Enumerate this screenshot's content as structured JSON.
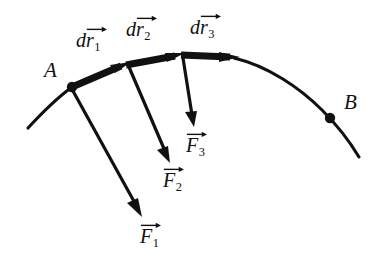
{
  "figure": {
    "type": "physics-vector-diagram",
    "background_color": "#ffffff",
    "ink_color": "#111111",
    "width": 378,
    "height": 268
  },
  "points": [
    {
      "id": "A",
      "label": "A",
      "label_x": 44,
      "label_y": 60,
      "dot_x": 72,
      "dot_y": 87,
      "dot_r": 5.2
    },
    {
      "id": "B",
      "label": "B",
      "label_x": 344,
      "label_y": 92,
      "dot_x": 330,
      "dot_y": 118,
      "dot_r": 5.2
    }
  ],
  "path": {
    "name": "trajectory-curve",
    "tail_start": {
      "x": 28,
      "y": 128
    },
    "tail_end": {
      "x": 72,
      "y": 87
    },
    "head_start": {
      "x": 234,
      "y": 58
    },
    "head_end": {
      "x": 359,
      "y": 157
    },
    "stroke_width": 3
  },
  "displacement_vectors": [
    {
      "id": "dr1",
      "prefix": "d",
      "symbol": "r",
      "subscript": "1",
      "from": {
        "x": 72,
        "y": 87
      },
      "to": {
        "x": 127,
        "y": 64
      },
      "label_x": 76,
      "label_y": 28,
      "stroke_width": 7
    },
    {
      "id": "dr2",
      "prefix": "d",
      "symbol": "r",
      "subscript": "2",
      "from": {
        "x": 127,
        "y": 64
      },
      "to": {
        "x": 181,
        "y": 55
      },
      "label_x": 126,
      "label_y": 17,
      "stroke_width": 7
    },
    {
      "id": "dr3",
      "prefix": "d",
      "symbol": "r",
      "subscript": "3",
      "from": {
        "x": 181,
        "y": 55
      },
      "to": {
        "x": 236,
        "y": 58
      },
      "label_x": 190,
      "label_y": 15,
      "stroke_width": 7
    }
  ],
  "force_vectors": [
    {
      "id": "F1",
      "symbol": "F",
      "subscript": "1",
      "from": {
        "x": 73,
        "y": 90
      },
      "to": {
        "x": 142,
        "y": 216
      },
      "label_x": 140,
      "label_y": 224,
      "stroke_width": 3.2
    },
    {
      "id": "F2",
      "symbol": "F",
      "subscript": "2",
      "from": {
        "x": 129,
        "y": 66
      },
      "to": {
        "x": 170,
        "y": 162
      },
      "label_x": 163,
      "label_y": 168,
      "stroke_width": 3.2
    },
    {
      "id": "F3",
      "symbol": "F",
      "subscript": "3",
      "from": {
        "x": 183,
        "y": 57
      },
      "to": {
        "x": 194,
        "y": 126
      },
      "label_x": 186,
      "label_y": 133,
      "stroke_width": 3.2
    }
  ]
}
